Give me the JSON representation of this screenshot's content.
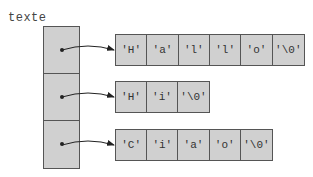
{
  "diagram": {
    "variable_label": "texte",
    "rows": [
      {
        "chars": [
          "'H'",
          "'a'",
          "'l'",
          "'l'",
          "'o'",
          "'\\0'"
        ]
      },
      {
        "chars": [
          "'H'",
          "'i'",
          "'\\0'"
        ]
      },
      {
        "chars": [
          "'C'",
          "'i'",
          "'a'",
          "'o'",
          "'\\0'"
        ]
      }
    ],
    "colors": {
      "cell_fill": "#d0d0d0",
      "border": "#555555",
      "arrow": "#222222"
    }
  }
}
